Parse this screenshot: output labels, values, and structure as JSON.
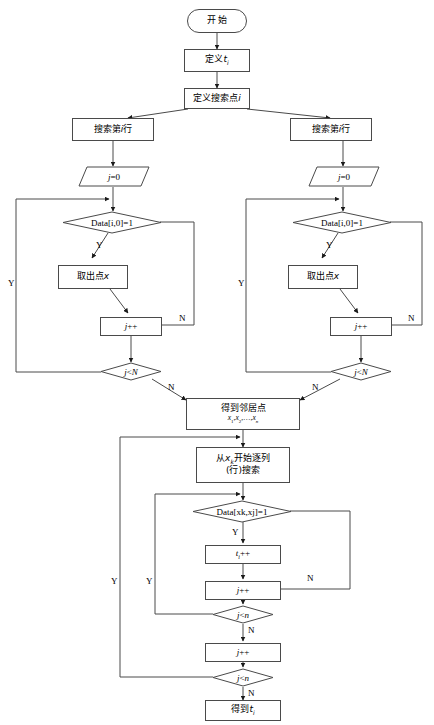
{
  "diagram": {
    "language": "zh-CN",
    "canvas": {
      "width": 434,
      "height": 725
    },
    "stroke_color": "#4a4a4a",
    "text_color": "#000000",
    "background": "#ffffff"
  },
  "nodes": {
    "start": {
      "label": "开  始",
      "shape": "terminal"
    },
    "define_t": {
      "label_main": "定义",
      "label_var": "t",
      "label_sub": "i",
      "shape": "process"
    },
    "define_point": {
      "label_main": "定义搜索点",
      "label_var": "i",
      "shape": "process"
    },
    "search_row_left": {
      "label_main": "搜索第",
      "label_var": "i",
      "label_tail": "行",
      "shape": "process"
    },
    "search_row_right": {
      "label_main": "搜索第",
      "label_var": "i",
      "label_tail": "行",
      "shape": "process"
    },
    "init_j_left": {
      "label_var": "j",
      "label_tail": "=0",
      "shape": "data"
    },
    "init_j_right": {
      "label_var": "j",
      "label_tail": "=0",
      "shape": "data"
    },
    "cond_data_left": {
      "label": "Data[i,0]=1",
      "shape": "decision"
    },
    "cond_data_right": {
      "label": "Data[i,0]=1",
      "shape": "decision"
    },
    "take_point_left": {
      "label_main": "取出点",
      "label_var": "x",
      "shape": "process"
    },
    "take_point_right": {
      "label_main": "取出点",
      "label_var": "x",
      "shape": "process"
    },
    "incr_j_left": {
      "label_var": "j",
      "label_tail": "++",
      "shape": "process"
    },
    "incr_j_right": {
      "label_var": "j",
      "label_tail": "++",
      "shape": "process"
    },
    "cond_jN_left": {
      "label_var": "j",
      "label_op": "<",
      "label_var2": "N",
      "shape": "decision"
    },
    "cond_jN_right": {
      "label_var": "j",
      "label_op": "<",
      "label_var2": "N",
      "shape": "decision"
    },
    "neighbors": {
      "line1": "得到邻居点",
      "line2_parts": [
        "x",
        "1",
        ",",
        "x",
        "2",
        ",…,",
        "x",
        "n"
      ],
      "shape": "process"
    },
    "scan_from_xk": {
      "line1_main": "从",
      "line1_var": "x",
      "line1_sub": "k",
      "line1_tail": "开始逐列",
      "line2": "(行)搜索",
      "shape": "process"
    },
    "cond_data_xk": {
      "label": "Data[xk,xj]=1",
      "shape": "decision"
    },
    "incr_ti": {
      "label_var": "t",
      "label_sub": "i",
      "label_tail": "++",
      "shape": "process"
    },
    "incr_j_mid": {
      "label_var": "j",
      "label_tail": "++",
      "shape": "process"
    },
    "cond_jn_inner": {
      "label_var": "j",
      "label_op": "<",
      "label_var2": "n",
      "shape": "decision"
    },
    "incr_j_outer": {
      "label_var": "j",
      "label_tail": "++",
      "shape": "process"
    },
    "cond_jn_outer": {
      "label_var": "j",
      "label_op": "<",
      "label_var2": "n",
      "shape": "decision"
    },
    "result": {
      "label_main": "得到",
      "label_var": "t",
      "label_sub": "i",
      "shape": "process"
    }
  },
  "edge_labels": {
    "yes_left_data": "Y",
    "no_left_data": "N",
    "yes_left_loop": "Y",
    "no_left_jn": "N",
    "yes_right_data": "Y",
    "no_right_data": "N",
    "yes_right_loop": "Y",
    "no_right_jn": "N",
    "yes_mid_data": "Y",
    "no_mid_data": "N",
    "no_inner_jn": "N",
    "yes_inner_loop": "Y",
    "no_outer_jn": "N",
    "yes_outer_loop": "Y",
    "no_result": "N"
  }
}
